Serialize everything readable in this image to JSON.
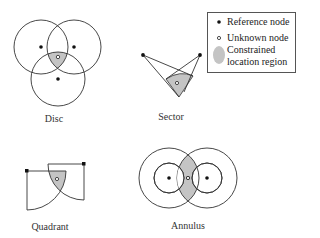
{
  "figure": {
    "panels": [
      {
        "id": "disc",
        "label": "Disc"
      },
      {
        "id": "sector",
        "label": "Sector"
      },
      {
        "id": "quadrant",
        "label": "Quadrant"
      },
      {
        "id": "annulus",
        "label": "Annulus"
      }
    ],
    "legend": {
      "items": [
        {
          "icon": "filled-dot-icon",
          "label": "Reference node"
        },
        {
          "icon": "hollow-dot-icon",
          "label": "Unknown node"
        },
        {
          "icon": "gray-ellipse-icon",
          "label_line1": "Constrained",
          "label_line2": "location region"
        }
      ]
    },
    "colors": {
      "stroke": "#333333",
      "region_fill": "#c4c4c4",
      "node": "#111111"
    }
  }
}
